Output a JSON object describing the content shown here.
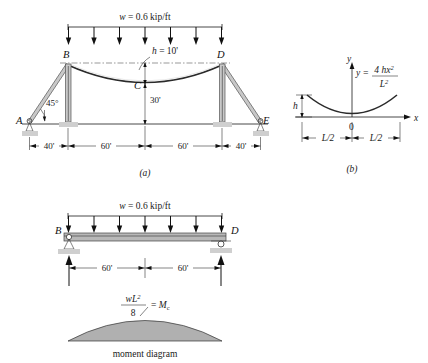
{
  "figure": {
    "panel_a": {
      "id": "(a)",
      "load_label": "w = 0.6 kip/ft",
      "sag_label": "h = 10'",
      "height_label": "30'",
      "angle_label": "45°",
      "points": [
        "A",
        "B",
        "C",
        "D",
        "E"
      ],
      "dimensions": [
        "40'",
        "60'",
        "60'",
        "40'"
      ],
      "load_arrow_count": 7
    },
    "panel_b": {
      "id": "(b)",
      "equation_lhs": "y =",
      "equation_num": "4 hx",
      "equation_num_sup": "2",
      "equation_den": "L",
      "equation_den_sup": "2",
      "axis_y": "y",
      "axis_x": "x",
      "origin": "0",
      "sag_label": "h",
      "half_span_left": "L/2",
      "half_span_right": "L/2"
    },
    "panel_c": {
      "load_label": "w = 0.6 kip/ft",
      "points": [
        "B",
        "D"
      ],
      "dimensions": [
        "60'",
        "60'"
      ],
      "load_arrow_count": 7,
      "moment_num": "wL",
      "moment_num_sup": "2",
      "moment_den": "8",
      "moment_eq": "= M",
      "moment_sub": "c",
      "caption": "moment diagram"
    }
  },
  "colors": {
    "line": "#1a1a1a",
    "member_fill": "#c8c8c8",
    "deck_fill": "#b8b8b8",
    "moment_fill": "#b0b0b0",
    "hatch": "#cfcfcf",
    "cable": "#2a2a2a"
  }
}
